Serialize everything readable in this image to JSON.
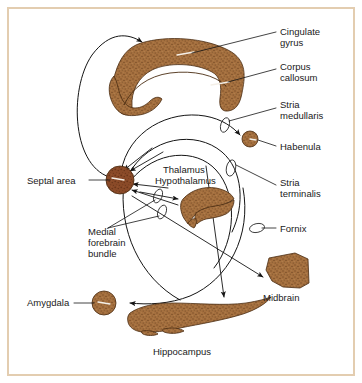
{
  "figure": {
    "background_color": "#ffffff",
    "frame_color": "#e3cdb0",
    "structure_fill": "#a5703f",
    "structure_fill_dark": "#8a4a28",
    "structure_outline": "#4a2c12",
    "line_color": "#141414",
    "text_color": "#1a1a1a"
  },
  "labels": {
    "cingulate_gyrus": "Cingulate\ngyrus",
    "cingulate_gyrus_l1": "Cingulate",
    "cingulate_gyrus_l2": "gyrus",
    "corpus_callosum_l1": "Corpus",
    "corpus_callosum_l2": "callosum",
    "stria_medullaris_l1": "Stria",
    "stria_medullaris_l2": "medullaris",
    "habenula": "Habenula",
    "stria_terminalis_l1": "Stria",
    "stria_terminalis_l2": "terminalis",
    "fornix": "Fornix",
    "septal_area": "Septal area",
    "thalamus": "Thalamus",
    "hypothalamus": "Hypothalamus",
    "medial_forebrain_bundle_l1": "Medial",
    "medial_forebrain_bundle_l2": "forebrain",
    "medial_forebrain_bundle_l3": "bundle",
    "amygdala": "Amygdala",
    "hippocampus": "Hippocampus",
    "midbrain": "Midbrain"
  },
  "structures": [
    {
      "name": "cingulate-gyrus",
      "label": "Cingulate gyrus"
    },
    {
      "name": "corpus-callosum",
      "label": "Corpus callosum"
    },
    {
      "name": "habenula",
      "label": "Habenula"
    },
    {
      "name": "septal-area",
      "label": "Septal area"
    },
    {
      "name": "thalamus-hypothalamus",
      "label": "Thalamus Hypothalamus"
    },
    {
      "name": "amygdala",
      "label": "Amygdala"
    },
    {
      "name": "hippocampus",
      "label": "Hippocampus"
    },
    {
      "name": "midbrain",
      "label": "Midbrain"
    }
  ],
  "tracts": [
    {
      "name": "stria-medullaris",
      "label": "Stria medullaris"
    },
    {
      "name": "stria-terminalis",
      "label": "Stria terminalis"
    },
    {
      "name": "fornix",
      "label": "Fornix"
    },
    {
      "name": "medial-forebrain-bundle",
      "label": "Medial forebrain bundle"
    },
    {
      "name": "cingulum",
      "label": "Cingulate pathway"
    }
  ]
}
